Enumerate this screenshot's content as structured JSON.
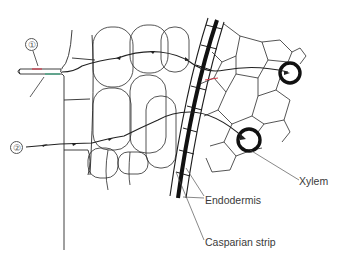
{
  "diagram": {
    "pathway_markers": [
      {
        "id": "1",
        "label": "①"
      },
      {
        "id": "2",
        "label": "②"
      }
    ],
    "labels": {
      "xylem": "Xylem",
      "endodermis": "Endodermis",
      "casparian_strip": "Casparian strip"
    },
    "colors": {
      "line": "#2a2a2a",
      "thick_line": "#111111",
      "label_text": "#3a3a3a",
      "accent_red": "#d23a4a",
      "accent_green": "#3aa882",
      "background": "#ffffff"
    }
  }
}
